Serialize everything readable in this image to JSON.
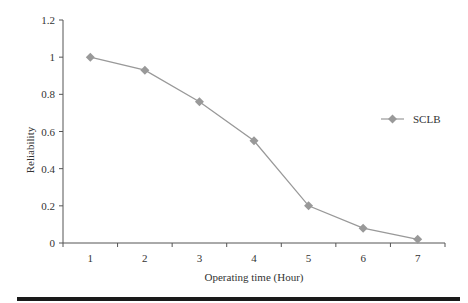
{
  "chart_data": {
    "type": "line",
    "title": "",
    "xlabel": "Operating time (Hour)",
    "ylabel": "Reliability",
    "categories": [
      "1",
      "2",
      "3",
      "4",
      "5",
      "6",
      "7"
    ],
    "series": [
      {
        "name": "SCLB",
        "values": [
          1.0,
          0.93,
          0.76,
          0.55,
          0.2,
          0.08,
          0.02
        ],
        "color": "#999999",
        "marker": "diamond"
      }
    ],
    "ylim": [
      0,
      1.2
    ],
    "yticks": [
      "0",
      "0.2",
      "0.4",
      "0.6",
      "0.8",
      "1",
      "1.2"
    ],
    "grid": false,
    "legend_position": "right"
  },
  "legend": {
    "label": "SCLB"
  },
  "axes": {
    "xlabel": "Operating time (Hour)",
    "ylabel": "Reliability"
  }
}
